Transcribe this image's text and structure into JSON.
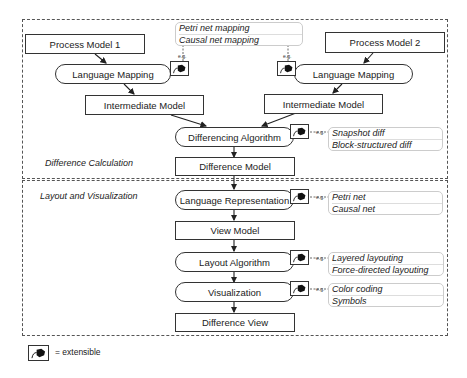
{
  "nodes": {
    "process_model_1": "Process Model 1",
    "process_model_2": "Process Model 2",
    "language_mapping_left": "Language Mapping",
    "language_mapping_right": "Language Mapping",
    "intermediate_left": "Intermediate Model",
    "intermediate_right": "Intermediate Model",
    "differencing_algorithm": "Differencing Algorithm",
    "difference_model": "Difference Model",
    "language_representation": "Language Representation",
    "view_model": "View Model",
    "layout_algorithm": "Layout Algorithm",
    "visualization": "Visualization",
    "difference_view": "Difference View"
  },
  "sections": {
    "difference_calculation": "Difference Calculation",
    "layout_visualization": "Layout and Visualization"
  },
  "examples": {
    "eg": "e.g.",
    "mapping": [
      "Petri net mapping",
      "Causal net mapping"
    ],
    "differencing": [
      "Snapshot diff",
      "Block-structured diff"
    ],
    "representation": [
      "Petri net",
      "Causal net"
    ],
    "layout": [
      "Layered layouting",
      "Force-directed layouting"
    ],
    "visualization": [
      "Color coding",
      "Symbols"
    ]
  },
  "legend": {
    "text": "= extensible",
    "icon": "plug-icon"
  }
}
